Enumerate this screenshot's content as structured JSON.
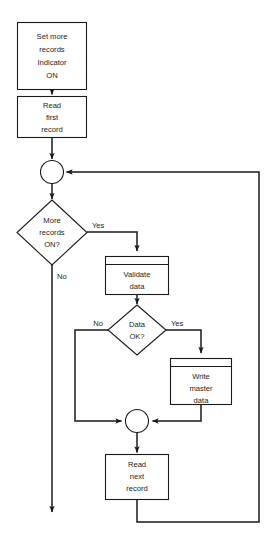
{
  "diagram": {
    "colors": {
      "stroke": "#1a1a1a",
      "text": "#1c1c1c",
      "background": "#ffffff"
    },
    "nodes": [
      {
        "id": "set-indicator",
        "type": "process",
        "lines": [
          "Set more",
          "records",
          "Indicator",
          "ON"
        ]
      },
      {
        "id": "read-first",
        "type": "process",
        "lines": [
          "Read",
          "first",
          "record"
        ]
      },
      {
        "id": "junction-top",
        "type": "connector",
        "lines": []
      },
      {
        "id": "more-records",
        "type": "decision",
        "lines": [
          "More",
          "records",
          "ON?"
        ]
      },
      {
        "id": "validate-data",
        "type": "process-header",
        "lines": [
          "Validate",
          "data"
        ]
      },
      {
        "id": "data-ok",
        "type": "decision",
        "lines": [
          "Data",
          "OK?"
        ]
      },
      {
        "id": "write-master",
        "type": "process-header",
        "lines": [
          "Write",
          "master",
          "data"
        ]
      },
      {
        "id": "junction-bottom",
        "type": "connector",
        "lines": []
      },
      {
        "id": "read-next",
        "type": "process",
        "lines": [
          "Read",
          "next",
          "record"
        ]
      }
    ],
    "edge_labels": {
      "more_records_yes": "Yes",
      "more_records_no": "No",
      "data_ok_yes": "Yes",
      "data_ok_no": "No"
    },
    "node_text": {
      "set_indicator_l1": "Set more",
      "set_indicator_l2": "records",
      "set_indicator_l3": "Indicator",
      "set_indicator_l4": "ON",
      "read_first_l1": "Read",
      "read_first_l2": "first",
      "read_first_l3": "record",
      "more_records_l1": "More",
      "more_records_l2": "records",
      "more_records_l3": "ON?",
      "validate_l1": "Validate",
      "validate_l2": "data",
      "data_ok_l1": "Data",
      "data_ok_l2": "OK?",
      "write_master_l1": "Write",
      "write_master_l2": "master",
      "write_master_l3": "data",
      "read_next_l1": "Read",
      "read_next_l2": "next",
      "read_next_l3": "record"
    }
  }
}
